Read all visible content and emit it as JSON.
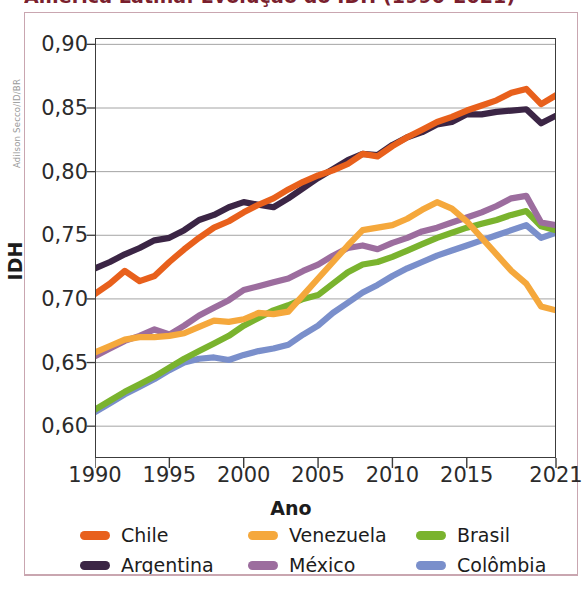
{
  "figure": {
    "title": "América Latina: Evolução do IDH (1990-2021)",
    "credit": "Adilson Secco/ID/BR"
  },
  "axes": {
    "y_title": "IDH",
    "x_title": "Ano",
    "y_ticks": [
      "0,60",
      "0,65",
      "0,70",
      "0,75",
      "0,80",
      "0,85",
      "0,90"
    ],
    "x_ticks": [
      "1990",
      "1995",
      "2000",
      "2005",
      "2010",
      "2015",
      "2021"
    ]
  },
  "legend": {
    "items": [
      {
        "label": "Chile",
        "color": "#e8601c"
      },
      {
        "label": "Argentina",
        "color": "#3b2545"
      },
      {
        "label": "Venezuela",
        "color": "#f5a83c"
      },
      {
        "label": "México",
        "color": "#9c6d9e"
      },
      {
        "label": "Brasil",
        "color": "#7ab32e"
      },
      {
        "label": "Colômbia",
        "color": "#7a8fcb"
      }
    ]
  },
  "chart_data": {
    "type": "line",
    "title": "América Latina: Evolução do IDH (1990-2021)",
    "xlabel": "Ano",
    "ylabel": "IDH",
    "xlim": [
      1990,
      2021
    ],
    "ylim": [
      0.575,
      0.905
    ],
    "grid": true,
    "legend_position": "bottom",
    "x": [
      1990,
      1991,
      1992,
      1993,
      1994,
      1995,
      1996,
      1997,
      1998,
      1999,
      2000,
      2001,
      2002,
      2003,
      2004,
      2005,
      2006,
      2007,
      2008,
      2009,
      2010,
      2011,
      2012,
      2013,
      2014,
      2015,
      2016,
      2017,
      2018,
      2019,
      2020,
      2021
    ],
    "series": [
      {
        "name": "Chile",
        "color": "#e8601c",
        "values": [
          0.704,
          0.712,
          0.722,
          0.714,
          0.718,
          0.729,
          0.739,
          0.748,
          0.756,
          0.761,
          0.768,
          0.774,
          0.779,
          0.786,
          0.792,
          0.797,
          0.801,
          0.806,
          0.814,
          0.812,
          0.82,
          0.827,
          0.833,
          0.839,
          0.843,
          0.848,
          0.852,
          0.856,
          0.862,
          0.865,
          0.853,
          0.86
        ]
      },
      {
        "name": "Argentina",
        "color": "#3b2545",
        "values": [
          0.724,
          0.729,
          0.735,
          0.74,
          0.746,
          0.748,
          0.754,
          0.762,
          0.766,
          0.772,
          0.776,
          0.774,
          0.772,
          0.779,
          0.787,
          0.795,
          0.802,
          0.809,
          0.814,
          0.813,
          0.821,
          0.827,
          0.831,
          0.837,
          0.839,
          0.845,
          0.845,
          0.847,
          0.848,
          0.849,
          0.838,
          0.844
        ]
      },
      {
        "name": "Venezuela",
        "color": "#f5a83c",
        "values": [
          0.658,
          0.663,
          0.668,
          0.67,
          0.67,
          0.671,
          0.673,
          0.678,
          0.683,
          0.682,
          0.684,
          0.689,
          0.688,
          0.69,
          0.703,
          0.716,
          0.729,
          0.742,
          0.754,
          0.756,
          0.758,
          0.763,
          0.77,
          0.776,
          0.771,
          0.761,
          0.748,
          0.735,
          0.722,
          0.712,
          0.694,
          0.691
        ]
      },
      {
        "name": "México",
        "color": "#9c6d9e",
        "values": [
          0.655,
          0.661,
          0.667,
          0.671,
          0.676,
          0.672,
          0.679,
          0.687,
          0.693,
          0.699,
          0.707,
          0.71,
          0.713,
          0.716,
          0.722,
          0.727,
          0.734,
          0.74,
          0.742,
          0.739,
          0.744,
          0.748,
          0.753,
          0.756,
          0.76,
          0.764,
          0.768,
          0.773,
          0.779,
          0.781,
          0.76,
          0.758
        ]
      },
      {
        "name": "Brasil",
        "color": "#7ab32e",
        "values": [
          0.613,
          0.62,
          0.627,
          0.633,
          0.639,
          0.646,
          0.653,
          0.659,
          0.665,
          0.671,
          0.679,
          0.685,
          0.691,
          0.695,
          0.7,
          0.703,
          0.712,
          0.721,
          0.727,
          0.729,
          0.733,
          0.738,
          0.743,
          0.748,
          0.752,
          0.756,
          0.759,
          0.762,
          0.766,
          0.769,
          0.757,
          0.754
        ]
      },
      {
        "name": "Colômbia",
        "color": "#7a8fcb",
        "values": [
          0.611,
          0.618,
          0.625,
          0.631,
          0.637,
          0.644,
          0.65,
          0.653,
          0.654,
          0.652,
          0.656,
          0.659,
          0.661,
          0.664,
          0.672,
          0.679,
          0.689,
          0.697,
          0.705,
          0.711,
          0.718,
          0.724,
          0.729,
          0.734,
          0.738,
          0.742,
          0.746,
          0.75,
          0.754,
          0.758,
          0.748,
          0.752
        ]
      }
    ]
  }
}
